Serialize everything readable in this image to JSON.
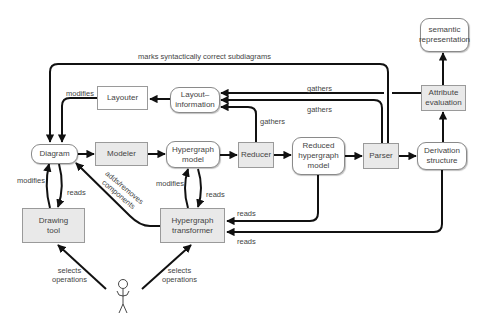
{
  "diagram": {
    "colors": {
      "edge": "#111111",
      "box_gray": "#e9e9e9",
      "border": "#9a9a9a",
      "text": "#444444"
    },
    "nodes": {
      "diagram": "Diagram",
      "drawing_tool": "Drawing\ntool",
      "layouter": "Layouter",
      "layout_information": "Layout–\ninformation",
      "modeler": "Modeler",
      "hypergraph_model": "Hypergraph\nmodel",
      "reducer": "Reducer",
      "reduced_hypergraph_model": "Reduced\nhypergraph\nmodel",
      "parser": "Parser",
      "derivation_structure": "Derivation\nstructure",
      "attribute_evaluation": "Attribute\nevaluation",
      "semantic_representation": "semantic\nrepresentation",
      "hypergraph_transformer": "Hypergraph\ntransformer"
    },
    "edge_labels": {
      "marks": "marks syntactically correct subdiagrams",
      "layouter_modifies": "modifies",
      "gathers_attr": "gathers",
      "gathers_parser": "gathers",
      "gathers_reducer": "gathers",
      "drawing_modifies": "modifies",
      "drawing_reads": "reads",
      "adds_removes": "adds/removes\ncomponents",
      "transformer_modifies": "modifies",
      "transformer_reads": "reads",
      "reads_reduced": "reads",
      "reads_derivation": "reads",
      "user_selects_left": "selects\noperations",
      "user_selects_right": "selects\noperations"
    },
    "actor": "user"
  }
}
